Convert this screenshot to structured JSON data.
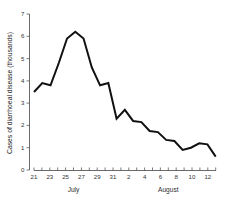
{
  "chart_data": {
    "type": "line",
    "title": "",
    "subtitle": "",
    "xlabel": "",
    "ylabel": "Cases of diarrhoeal disease (thousands)",
    "xlim": [
      20.4,
      33.6
    ],
    "ylim": [
      0,
      7
    ],
    "grid": false,
    "legend": null,
    "y_ticks": [
      0,
      1,
      2,
      3,
      4,
      5,
      6,
      7
    ],
    "y_tick_labels": [
      "0",
      "1",
      "2",
      "3",
      "4",
      "5",
      "6",
      "7"
    ],
    "x_tick_labels": [
      "21",
      "23",
      "25",
      "27",
      "29",
      "31",
      "2",
      "4",
      "6",
      "8",
      "10",
      "12"
    ],
    "x_tick_values": [
      21,
      23,
      25,
      27,
      29,
      31,
      33,
      35,
      37,
      39,
      41,
      43
    ],
    "x_minor_step": 1,
    "month_labels": [
      {
        "text": "July",
        "at": 26
      },
      {
        "text": "August",
        "at": 38
      }
    ],
    "series": [
      {
        "name": "Cases of diarrhoeal disease",
        "color": "#111111",
        "x": [
          21,
          22,
          23,
          24,
          25,
          26,
          27,
          28,
          29,
          30,
          31,
          32,
          33,
          34,
          35,
          36,
          37,
          38,
          39,
          40,
          41,
          42,
          43
        ],
        "x_date_labels": [
          "July 21",
          "July 22",
          "July 23",
          "July 24",
          "July 25",
          "July 26",
          "July 27",
          "July 28",
          "July 29",
          "July 30",
          "July 31",
          "August 1",
          "August 2",
          "August 3",
          "August 4",
          "August 5",
          "August 6",
          "August 7",
          "August 8",
          "August 9",
          "August 10",
          "August 11",
          "August 12"
        ],
        "values": [
          3.5,
          3.9,
          3.8,
          4.8,
          5.9,
          6.2,
          5.9,
          4.6,
          3.8,
          3.9,
          2.3,
          2.7,
          2.2,
          2.15,
          1.75,
          1.7,
          1.35,
          1.3,
          0.9,
          1.0,
          1.2,
          1.15,
          0.6
        ]
      }
    ]
  },
  "axis": {
    "y_label": "Cases of diarrhoeal disease (thousands)",
    "tick_color": "#5a5a5a",
    "line_color": "#111111"
  }
}
